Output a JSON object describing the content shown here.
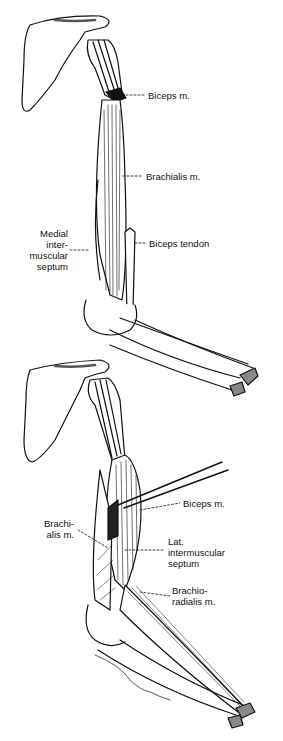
{
  "figure": {
    "top_panel": {
      "labels": {
        "biceps": "Biceps m.",
        "brachialis": "Brachialis m.",
        "medial_septum": "Medial\ninter-\nmuscular\nseptum",
        "biceps_tendon": "Biceps tendon"
      }
    },
    "bottom_panel": {
      "labels": {
        "biceps": "Biceps m.",
        "brachialis": "Brachi-\nalis m.",
        "lat_septum": "Lat.\nintermuscular\nseptum",
        "brachioradialis": "Brachio-\nradialis m."
      },
      "signature": "illustrator-signature"
    },
    "colors": {
      "ink": "#111111",
      "background": "#ffffff"
    }
  }
}
